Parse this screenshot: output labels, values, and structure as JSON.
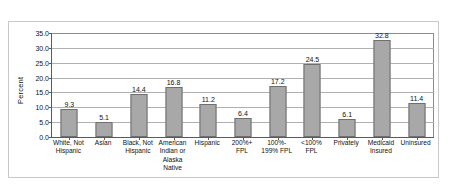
{
  "chart_data": {
    "type": "bar",
    "title": "",
    "subtitle": "",
    "xlabel": "",
    "ylabel": "Percent",
    "ylim": [
      0.0,
      35.0
    ],
    "ytick_step": 5.0,
    "ytick_labels": [
      "0.0",
      "5.0",
      "10.0",
      "15.0",
      "20.0",
      "25.0",
      "30.0",
      "35.0"
    ],
    "ytick_values": [
      0.0,
      5.0,
      10.0,
      15.0,
      20.0,
      25.0,
      30.0,
      35.0
    ],
    "grid": true,
    "grid_axis": "y",
    "legend": false,
    "legend_position": "none",
    "data_labels": true,
    "bar_color": "#a8a8a8",
    "bar_edge_color": "#6f6f6f",
    "axis_color": "#5a5a5a",
    "grid_color": "#b0b0b0",
    "frame_color": "#c9c9c9",
    "categories": [
      "White, Not\nHispanic",
      "Asian",
      "Black, Not\nHispanic",
      "American\nIndian or\nAlaska\nNative",
      "Hispanic",
      "200%+\nFPL",
      "100%-\n199% FPL",
      "<100%\nFPL",
      "Privately",
      "Medicaid\nInsured",
      "Uninsured"
    ],
    "values": [
      9.3,
      5.1,
      14.4,
      16.8,
      11.2,
      6.4,
      17.2,
      24.5,
      6.1,
      32.8,
      11.4
    ],
    "value_labels": [
      "9.3",
      "5.1",
      "14.4",
      "16.8",
      "11.2",
      "6.4",
      "17.2",
      "24.5",
      "6.1",
      "32.8",
      "11.4"
    ]
  }
}
